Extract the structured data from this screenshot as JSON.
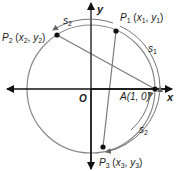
{
  "diagram": {
    "type": "unit-circle",
    "axes": {
      "x_label": "x",
      "y_label": "y",
      "origin_label": "O"
    },
    "points": {
      "A": {
        "label": "A(1, 0)"
      },
      "P1": {
        "name": "P",
        "sub": "1",
        "coords_x": "x",
        "coords_x_sub": "1",
        "coords_y": "y",
        "coords_y_sub": "1"
      },
      "P2": {
        "name": "P",
        "sub": "2",
        "coords_x": "x",
        "coords_x_sub": "2",
        "coords_y": "y",
        "coords_y_sub": "2"
      },
      "P3": {
        "name": "P",
        "sub": "3",
        "coords_x": "x",
        "coords_x_sub": "3",
        "coords_y": "y",
        "coords_y_sub": "3"
      }
    },
    "arcs": [
      {
        "name": "s",
        "sub": "2",
        "position": "top-left, from P1 to P2"
      },
      {
        "name": "s",
        "sub": "1",
        "position": "right-upper, from A to P1"
      },
      {
        "name": "s",
        "sub": "2",
        "position": "right-lower, from A to P3"
      }
    ],
    "segments": [
      "P2-A",
      "P1-P3"
    ],
    "colors": {
      "circle": "#8a8a8a",
      "axes": "#111111",
      "chords": "#7a7a7a",
      "points": "#111111"
    }
  }
}
